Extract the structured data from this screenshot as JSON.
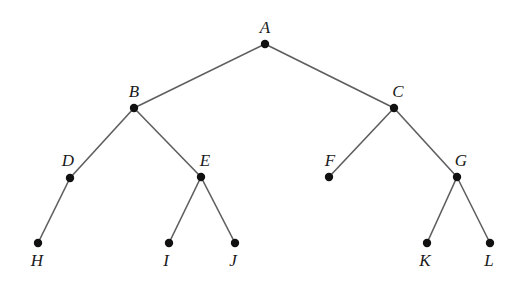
{
  "diagram": {
    "type": "binary-tree",
    "root": "A",
    "colors": {
      "edge": "#5e5e5e",
      "node": "#111111",
      "label": "#1a1a1a",
      "background": "#ffffff"
    },
    "nodes": [
      {
        "id": "A",
        "label": "A",
        "x": 265,
        "y": 44,
        "lx": 265,
        "ly": 33
      },
      {
        "id": "B",
        "label": "B",
        "x": 134,
        "y": 108,
        "lx": 134,
        "ly": 97
      },
      {
        "id": "C",
        "label": "C",
        "x": 394,
        "y": 108,
        "lx": 398,
        "ly": 97
      },
      {
        "id": "D",
        "label": "D",
        "x": 70,
        "y": 178,
        "lx": 68,
        "ly": 166
      },
      {
        "id": "E",
        "label": "E",
        "x": 201,
        "y": 177,
        "lx": 205,
        "ly": 166
      },
      {
        "id": "F",
        "label": "F",
        "x": 329,
        "y": 177,
        "lx": 330,
        "ly": 166
      },
      {
        "id": "G",
        "label": "G",
        "x": 457,
        "y": 177,
        "lx": 461,
        "ly": 166
      },
      {
        "id": "H",
        "label": "H",
        "x": 38,
        "y": 243,
        "lx": 37,
        "ly": 266
      },
      {
        "id": "I",
        "label": "I",
        "x": 169,
        "y": 243,
        "lx": 166,
        "ly": 266
      },
      {
        "id": "J",
        "label": "J",
        "x": 235,
        "y": 243,
        "lx": 233,
        "ly": 266
      },
      {
        "id": "K",
        "label": "K",
        "x": 427,
        "y": 243,
        "lx": 425,
        "ly": 266
      },
      {
        "id": "L",
        "label": "L",
        "x": 490,
        "y": 243,
        "lx": 489,
        "ly": 266
      }
    ],
    "edges": [
      {
        "from": "A",
        "to": "B"
      },
      {
        "from": "A",
        "to": "C"
      },
      {
        "from": "B",
        "to": "D"
      },
      {
        "from": "B",
        "to": "E"
      },
      {
        "from": "C",
        "to": "F"
      },
      {
        "from": "C",
        "to": "G"
      },
      {
        "from": "D",
        "to": "H"
      },
      {
        "from": "E",
        "to": "I"
      },
      {
        "from": "E",
        "to": "J"
      },
      {
        "from": "G",
        "to": "K"
      },
      {
        "from": "G",
        "to": "L"
      }
    ]
  }
}
